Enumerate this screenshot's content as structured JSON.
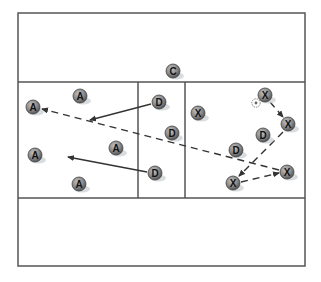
{
  "diagram": {
    "type": "soccer-drill",
    "field": {
      "x": 18,
      "y": 13,
      "width": 287,
      "height": 253,
      "line_color": "#555555"
    },
    "zones": {
      "top_line_y": 82,
      "bottom_line_y": 198,
      "center_left_x": 138,
      "center_right_x": 185
    },
    "players": [
      {
        "id": "c1",
        "label": "C",
        "team": "coach",
        "x": 173,
        "y": 71
      },
      {
        "id": "a1",
        "label": "A",
        "team": "attack",
        "x": 33,
        "y": 107
      },
      {
        "id": "a2",
        "label": "A",
        "team": "attack",
        "x": 80,
        "y": 96
      },
      {
        "id": "a3",
        "label": "A",
        "team": "attack",
        "x": 35,
        "y": 155
      },
      {
        "id": "a4",
        "label": "A",
        "team": "attack",
        "x": 116,
        "y": 148
      },
      {
        "id": "a5",
        "label": "A",
        "team": "attack",
        "x": 79,
        "y": 184
      },
      {
        "id": "d1",
        "label": "D",
        "team": "defense",
        "x": 159,
        "y": 102
      },
      {
        "id": "d2",
        "label": "D",
        "team": "defense",
        "x": 172,
        "y": 133
      },
      {
        "id": "d3",
        "label": "D",
        "team": "defense",
        "x": 155,
        "y": 173
      },
      {
        "id": "d4",
        "label": "D",
        "team": "defense",
        "x": 236,
        "y": 150
      },
      {
        "id": "d5",
        "label": "D",
        "team": "defense",
        "x": 263,
        "y": 135
      },
      {
        "id": "x1",
        "label": "X",
        "team": "opponent",
        "x": 198,
        "y": 113
      },
      {
        "id": "x2",
        "label": "X",
        "team": "opponent",
        "x": 265,
        "y": 95
      },
      {
        "id": "x3",
        "label": "X",
        "team": "opponent",
        "x": 288,
        "y": 124
      },
      {
        "id": "x4",
        "label": "X",
        "team": "opponent",
        "x": 287,
        "y": 172
      },
      {
        "id": "x5",
        "label": "X",
        "team": "opponent",
        "x": 233,
        "y": 183
      }
    ],
    "ball": {
      "x": 256,
      "y": 103
    },
    "arrows": [
      {
        "id": "run-d1",
        "style": "solid",
        "x1": 151,
        "y1": 104,
        "x2": 90,
        "y2": 120
      },
      {
        "id": "run-d3",
        "style": "solid",
        "x1": 147,
        "y1": 172,
        "x2": 68,
        "y2": 157
      },
      {
        "id": "pass-long",
        "style": "dashed",
        "x1": 279,
        "y1": 170,
        "x2": 42,
        "y2": 109
      },
      {
        "id": "pass-x2-x3",
        "style": "dashed",
        "x1": 270,
        "y1": 102,
        "x2": 283,
        "y2": 117
      },
      {
        "id": "pass-x3-x5",
        "style": "dashed",
        "x1": 283,
        "y1": 132,
        "x2": 239,
        "y2": 176
      },
      {
        "id": "pass-x5-x4",
        "style": "dashed",
        "x1": 241,
        "y1": 182,
        "x2": 279,
        "y2": 173
      }
    ],
    "colors": {
      "token_fill": "#8a8a8a",
      "token_stroke": "#444444",
      "token_shadow": "#cfd3d6",
      "line": "#333333"
    }
  }
}
